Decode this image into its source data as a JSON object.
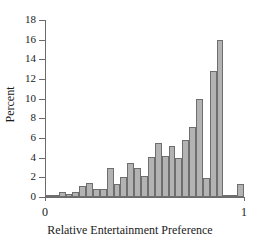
{
  "chart_data": {
    "type": "bar",
    "title": "",
    "xlabel": "Relative Entertainment Preference",
    "ylabel": "Percent",
    "xlim": [
      0,
      1
    ],
    "ylim": [
      0,
      18
    ],
    "grid": false,
    "legend": "none",
    "ytick_labels": [
      "0",
      "2",
      "4",
      "6",
      "8",
      "10",
      "12",
      "14",
      "16",
      "18"
    ],
    "ytick_values": [
      0,
      2,
      4,
      6,
      8,
      10,
      12,
      14,
      16,
      18
    ],
    "xtick_labels": [
      "0",
      "1"
    ],
    "xtick_values": [
      0,
      1
    ],
    "bin_width": 0.0345,
    "categories": [
      "0.00",
      "0.03",
      "0.07",
      "0.10",
      "0.14",
      "0.17",
      "0.21",
      "0.24",
      "0.28",
      "0.31",
      "0.34",
      "0.38",
      "0.41",
      "0.45",
      "0.48",
      "0.52",
      "0.55",
      "0.59",
      "0.62",
      "0.66",
      "0.69",
      "0.72",
      "0.76",
      "0.79",
      "0.83",
      "0.86",
      "0.90",
      "0.93",
      "0.97"
    ],
    "values": [
      0.15,
      0.25,
      0.5,
      0.3,
      0.55,
      1.1,
      1.45,
      0.85,
      0.85,
      3.0,
      1.35,
      2.0,
      3.5,
      2.9,
      2.15,
      4.1,
      5.45,
      4.15,
      5.15,
      4.0,
      5.75,
      7.1,
      10.0,
      1.9,
      12.85,
      15.95,
      0.2,
      0.25,
      1.35
    ],
    "bar_color": "#b3b3b3",
    "bar_edge_color": "#6e6e6e",
    "axis_color": "#6b6b6b",
    "text_color": "#1a1a1a",
    "background": "#ffffff"
  }
}
